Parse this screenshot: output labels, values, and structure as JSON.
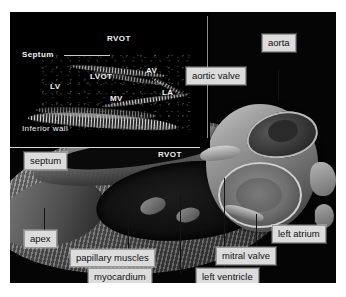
{
  "figure": {
    "background_color": "#050505",
    "page_background": "#ffffff",
    "label_box_color": "#dcdcdc",
    "label_text_color": "#111111",
    "leader_line_color": "#8e8e8e"
  },
  "echocardiogram": {
    "caption_labels": [
      {
        "name": "rvot",
        "text": "RVOT"
      },
      {
        "name": "septum",
        "text": "Septum"
      },
      {
        "name": "lvot",
        "text": "LVOT"
      },
      {
        "name": "av",
        "text": "AV"
      },
      {
        "name": "lv",
        "text": "LV"
      },
      {
        "name": "mv",
        "text": "MV"
      },
      {
        "name": "la",
        "text": "LA"
      },
      {
        "name": "inferior-wall",
        "text": "Inferior wall"
      }
    ]
  },
  "illustration": {
    "inline_labels": [
      {
        "name": "rvot",
        "text": "RVOT"
      }
    ],
    "callouts": [
      {
        "name": "aorta",
        "text": "aorta"
      },
      {
        "name": "aortic-valve",
        "text": "aortic valve"
      },
      {
        "name": "septum",
        "text": "septum"
      },
      {
        "name": "apex",
        "text": "apex"
      },
      {
        "name": "papillary-muscles",
        "text": "papillary muscles"
      },
      {
        "name": "myocardium",
        "text": "myocardium"
      },
      {
        "name": "left-ventricle",
        "text": "left ventricle"
      },
      {
        "name": "mitral-valve",
        "text": "mitral valve"
      },
      {
        "name": "left-atrium",
        "text": "left atrium"
      }
    ]
  }
}
